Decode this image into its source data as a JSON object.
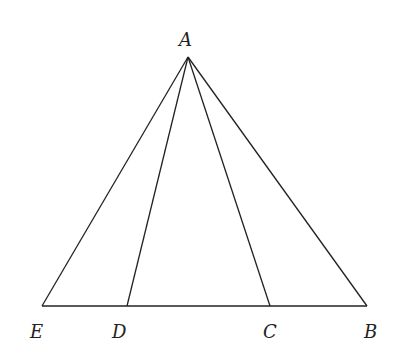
{
  "diagram": {
    "type": "geometry-triangle",
    "points": {
      "A": {
        "label": "A",
        "x": 188,
        "y": 57
      },
      "E": {
        "label": "E",
        "x": 42,
        "y": 306
      },
      "D": {
        "label": "D",
        "x": 127,
        "y": 306
      },
      "C": {
        "label": "C",
        "x": 270,
        "y": 306
      },
      "B": {
        "label": "B",
        "x": 367,
        "y": 306
      }
    },
    "segments": [
      [
        "A",
        "E"
      ],
      [
        "A",
        "D"
      ],
      [
        "A",
        "C"
      ],
      [
        "A",
        "B"
      ],
      [
        "E",
        "B"
      ]
    ],
    "colors": {
      "stroke": "#222222",
      "background": "#ffffff"
    }
  }
}
